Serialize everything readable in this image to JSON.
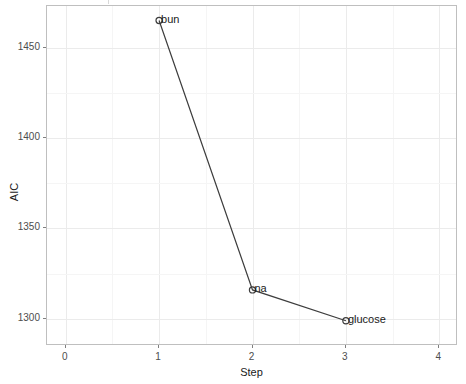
{
  "chart_data": {
    "type": "line",
    "title": "",
    "xlabel": "Step",
    "ylabel": "AIC",
    "x": [
      1,
      2,
      3
    ],
    "values": [
      1465,
      1316,
      1299
    ],
    "point_labels": [
      "bun",
      "na",
      "glucose"
    ],
    "xlim": [
      -0.2,
      4.2
    ],
    "ylim": [
      1285,
      1473
    ],
    "xticks": [
      "0",
      "1",
      "2",
      "3",
      "4"
    ],
    "xtick_values": [
      0,
      1,
      2,
      3,
      4
    ],
    "yticks": [
      "1300",
      "1350",
      "1400",
      "1450"
    ],
    "ytick_values": [
      1300,
      1350,
      1400,
      1450
    ],
    "grid": true,
    "legend": "none",
    "series": [
      {
        "name": "AIC by step",
        "points": [
          {
            "step": 1,
            "aic": 1465,
            "label": "bun"
          },
          {
            "step": 2,
            "aic": 1316,
            "label": "na"
          },
          {
            "step": 3,
            "aic": 1299,
            "label": "glucose"
          }
        ]
      }
    ],
    "colors": {
      "line": "#3d3d3d",
      "point": "#3d3d3d",
      "panel_background": "#ffffff",
      "major_grid": "#ebebeb",
      "minor_grid": "#f5f5f5",
      "panel_border": "#bfbfbf",
      "text": "#1a1a1a",
      "tick_text": "#4d4d4d"
    }
  }
}
